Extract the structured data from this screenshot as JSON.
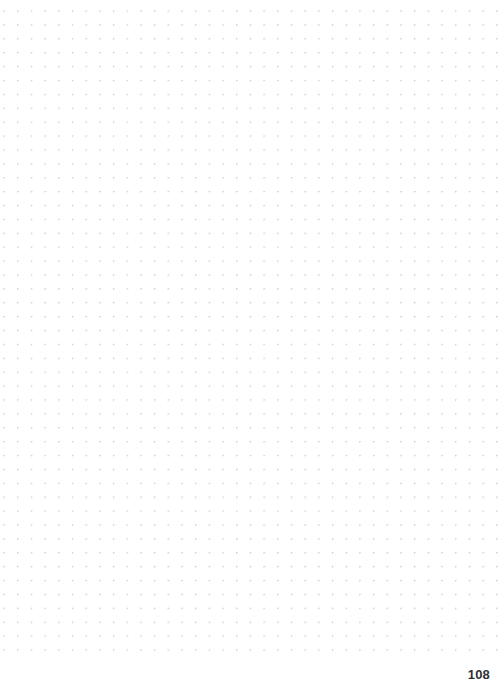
{
  "page": {
    "background_color": "#ffffff",
    "width": 503,
    "height": 690,
    "page_number": "108"
  },
  "dot_grid": {
    "dot_color": "#c9c9ce",
    "dot_radius_px": 0.6,
    "spacing_x_px": 13.7,
    "spacing_y_px": 13.9,
    "offset_x_px": 4,
    "offset_y_px": 11,
    "grid_bottom_px": 662,
    "columns": 37,
    "rows": 48
  }
}
